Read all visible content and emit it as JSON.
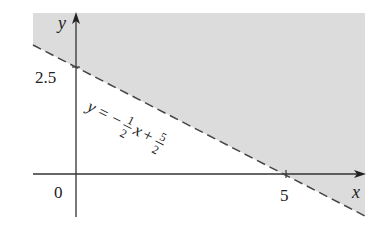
{
  "figure": {
    "type": "linear-inequality-graph",
    "axes": {
      "x_label": "x",
      "y_label": "y",
      "origin_label": "0",
      "x_tick_label": "5",
      "y_tick_label": "2.5"
    },
    "boundary_line": {
      "equation_parts": {
        "lhs": "y",
        "eq": "=",
        "minus": "−",
        "frac1_num": "1",
        "frac1_den": "2",
        "var": "x",
        "plus": "+",
        "frac2_num": "5",
        "frac2_den": "2"
      },
      "style": "dashed",
      "x_intercept": 5,
      "y_intercept": 2.5,
      "slope": -0.5
    },
    "shaded_region": "above line (y > -1/2 x + 5/2)",
    "colors": {
      "shade": "#dcdcdc",
      "axis": "#333333",
      "line": "#444444",
      "background": "#ffffff"
    }
  }
}
